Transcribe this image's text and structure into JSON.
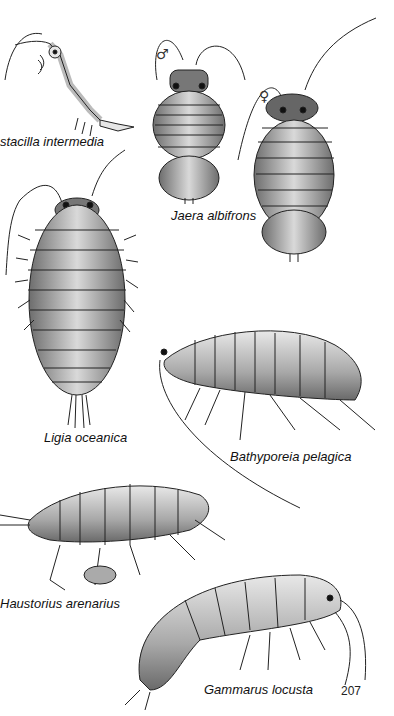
{
  "plate": {
    "page_number": "207",
    "background": "#ffffff",
    "ink": "#1a1a1a",
    "species": [
      {
        "id": "astacilla",
        "label": "stacilla intermedia",
        "x": 0,
        "y": 134
      },
      {
        "id": "jaera",
        "label": "Jaera albifrons",
        "x": 171,
        "y": 208
      },
      {
        "id": "ligia",
        "label": "Ligia oceanica",
        "x": 44,
        "y": 430
      },
      {
        "id": "bathyporeia",
        "label": "Bathyporeia pelagica",
        "x": 230,
        "y": 449
      },
      {
        "id": "haustorius",
        "label": "Haustorius  arenarius",
        "x": 0,
        "y": 596
      },
      {
        "id": "gammarus",
        "label": "Gammarus locusta",
        "x": 204,
        "y": 682
      }
    ],
    "symbols": {
      "male": "♂",
      "female": "♀"
    }
  }
}
